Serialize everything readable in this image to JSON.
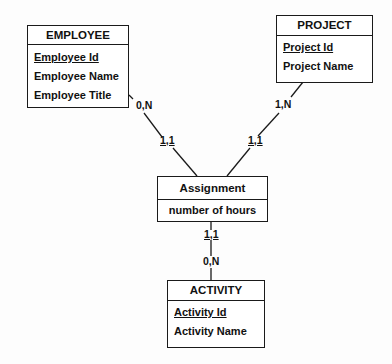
{
  "entities": {
    "employee": {
      "title": "EMPLOYEE",
      "attributes": [
        {
          "label": "Employee Id",
          "key": true
        },
        {
          "label": "Employee Name",
          "key": false
        },
        {
          "label": "Employee Title",
          "key": false
        }
      ]
    },
    "project": {
      "title": "PROJECT",
      "attributes": [
        {
          "label": "Project Id",
          "key": true
        },
        {
          "label": "Project Name",
          "key": false
        }
      ]
    },
    "assignment": {
      "title": "Assignment",
      "attributes": [
        {
          "label": "number of hours",
          "key": false
        }
      ]
    },
    "activity": {
      "title": "ACTIVITY",
      "attributes": [
        {
          "label": "Activity Id",
          "key": true
        },
        {
          "label": "Activity Name",
          "key": false
        }
      ]
    }
  },
  "relationships": {
    "employee_assignment": {
      "employee_side": "0,N",
      "assignment_side": "1,1"
    },
    "project_assignment": {
      "project_side": "1,N",
      "assignment_side": "1,1"
    },
    "assignment_activity": {
      "assignment_side": "1,1",
      "activity_side": "0,N"
    }
  }
}
